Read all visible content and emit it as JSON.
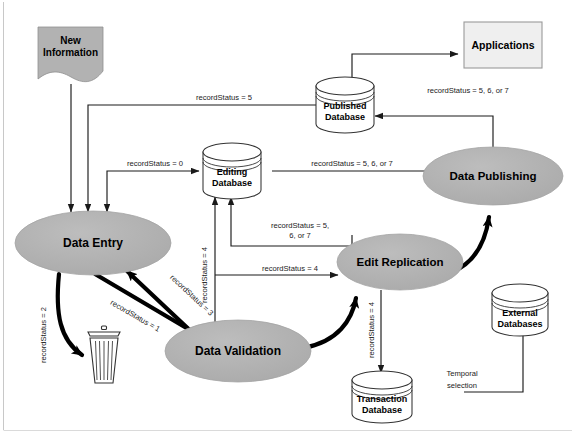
{
  "diagram": {
    "colors": {
      "process_fill": "#b3b3b3",
      "process_stroke": "#a0a0a0",
      "source_fill": "#b0b0b0",
      "applications_fill": "#efefef",
      "applications_stroke": "#9a9a9a",
      "database_fill": "#ffffff",
      "database_stroke": "#333333",
      "edge_thin": "#1a1a1a",
      "edge_thick": "#000000",
      "frame_line": "#c8c8c8"
    },
    "nodes": {
      "new_information": {
        "label_line1": "New",
        "label_line2": "Information",
        "shape": "banner"
      },
      "applications": {
        "label": "Applications",
        "shape": "rectangle"
      },
      "published_database": {
        "label_line1": "Published",
        "label_line2": "Database",
        "shape": "cylinder"
      },
      "editing_database": {
        "label_line1": "Editing",
        "label_line2": "Database",
        "shape": "cylinder"
      },
      "transaction_database": {
        "label_line1": "Transaction",
        "label_line2": "Database",
        "shape": "cylinder"
      },
      "external_databases": {
        "label_line1": "External",
        "label_line2": "Databases",
        "shape": "cylinder"
      },
      "data_entry": {
        "label": "Data Entry",
        "shape": "ellipse"
      },
      "data_validation": {
        "label": "Data Validation",
        "shape": "ellipse"
      },
      "edit_replication": {
        "label": "Edit Replication",
        "shape": "ellipse"
      },
      "data_publishing": {
        "label": "Data Publishing",
        "shape": "ellipse"
      },
      "trash": {
        "label": "",
        "shape": "trash-can-icon"
      }
    },
    "edge_labels": {
      "published_to_entry": "recordStatus = 5",
      "entry_to_editing": "recordStatus = 0",
      "editing_to_publishing": "recordStatus = 5, 6, or 7",
      "publishing_to_published": "recordStatus = 5, 6, or 7",
      "replication_to_editing_line1": "recordStatus = 5,",
      "replication_to_editing_line2": "6, or 7",
      "validation_to_replication": "recordStatus = 4",
      "validation_to_editing": "recordStatus = 4",
      "entry_to_trash": "recordStatus = 2",
      "entry_to_validation": "recordStatus = 1",
      "validation_to_entry": "recordStatus = 3",
      "replication_to_transaction": "recordStatus = 4",
      "temporal_selection_line1": "Temporal",
      "temporal_selection_line2": "selection"
    }
  }
}
